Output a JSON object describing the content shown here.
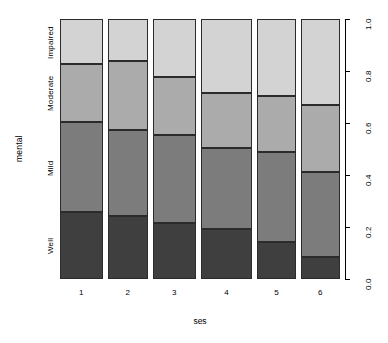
{
  "chart_data": {
    "type": "bar",
    "subtype": "spineplot-stacked-proportional",
    "title": "",
    "xlabel": "ses",
    "ylabel": "mental",
    "categories": [
      "1",
      "2",
      "3",
      "4",
      "5",
      "6"
    ],
    "category_labels_axis": "ses",
    "response_levels": [
      "Well",
      "Mild",
      "Moderate",
      "Impaired"
    ],
    "response_level_colors": [
      "#3f3f3f",
      "#7c7c7c",
      "#ababab",
      "#d3d3d3"
    ],
    "ylim": [
      0.0,
      1.0
    ],
    "ytick_labels": [
      "0.0",
      "0.2",
      "0.4",
      "0.6",
      "0.8",
      "1.0"
    ],
    "ytick_values": [
      0.0,
      0.2,
      0.4,
      0.6,
      0.8,
      1.0
    ],
    "yaxis_position": "right",
    "grid": false,
    "legend": "none (levels labelled on left axis)",
    "series": [
      {
        "name": "Well",
        "values": [
          0.258,
          0.242,
          0.215,
          0.192,
          0.142,
          0.085
        ]
      },
      {
        "name": "Mild",
        "values": [
          0.346,
          0.331,
          0.338,
          0.312,
          0.346,
          0.327
        ]
      },
      {
        "name": "Moderate",
        "values": [
          0.223,
          0.265,
          0.223,
          0.212,
          0.215,
          0.258
        ]
      },
      {
        "name": "Impaired",
        "values": [
          0.173,
          0.162,
          0.224,
          0.284,
          0.297,
          0.331
        ]
      }
    ],
    "bar_widths_relative": [
      0.165,
      0.155,
      0.165,
      0.2,
      0.148,
      0.152
    ]
  },
  "axes": {
    "y_left_level_labels": [
      "Well",
      "Mild",
      "Moderate",
      "Impaired"
    ],
    "y_left_title": "mental",
    "x_title": "ses",
    "x_tick_labels": [
      "1",
      "2",
      "3",
      "4",
      "5",
      "6"
    ],
    "y_right_tick_labels": [
      "0.0",
      "0.2",
      "0.4",
      "0.6",
      "0.8",
      "1.0"
    ]
  }
}
